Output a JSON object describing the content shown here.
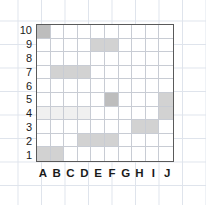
{
  "figure": {
    "type": "grid-coordinate-chart",
    "columns": [
      "A",
      "B",
      "C",
      "D",
      "E",
      "F",
      "G",
      "H",
      "I",
      "J"
    ],
    "rows": [
      "10",
      "9",
      "8",
      "7",
      "6",
      "5",
      "4",
      "3",
      "2",
      "1"
    ],
    "border_color": "#5a5a5a",
    "gridline_color": "#c8ccd4",
    "background_color": "#ffffff"
  },
  "chart_data": {
    "type": "heatmap",
    "title": "",
    "xlabel": "",
    "ylabel": "",
    "x_categories": [
      "A",
      "B",
      "C",
      "D",
      "E",
      "F",
      "G",
      "H",
      "I",
      "J"
    ],
    "y_categories": [
      "10",
      "9",
      "8",
      "7",
      "6",
      "5",
      "4",
      "3",
      "2",
      "1"
    ],
    "grid": true,
    "legend": "none",
    "shades": {
      "empty": "#ffffff",
      "faint": "#f0f0f0",
      "light": "#e2e2e2",
      "medium": "#d2d2d2",
      "dark": "#bdbdbd"
    },
    "values": [
      [
        "dark",
        "empty",
        "empty",
        "empty",
        "empty",
        "empty",
        "empty",
        "empty",
        "empty",
        "empty"
      ],
      [
        "empty",
        "empty",
        "empty",
        "empty",
        "medium",
        "medium",
        "empty",
        "empty",
        "empty",
        "empty"
      ],
      [
        "empty",
        "empty",
        "empty",
        "empty",
        "empty",
        "empty",
        "empty",
        "empty",
        "empty",
        "empty"
      ],
      [
        "empty",
        "medium",
        "medium",
        "medium",
        "empty",
        "empty",
        "empty",
        "empty",
        "empty",
        "empty"
      ],
      [
        "empty",
        "empty",
        "empty",
        "empty",
        "empty",
        "empty",
        "empty",
        "empty",
        "empty",
        "empty"
      ],
      [
        "empty",
        "empty",
        "empty",
        "empty",
        "empty",
        "dark",
        "empty",
        "empty",
        "empty",
        "medium"
      ],
      [
        "faint",
        "faint",
        "faint",
        "faint",
        "empty",
        "empty",
        "empty",
        "empty",
        "empty",
        "medium"
      ],
      [
        "empty",
        "empty",
        "empty",
        "empty",
        "empty",
        "empty",
        "empty",
        "medium",
        "medium",
        "empty"
      ],
      [
        "empty",
        "empty",
        "empty",
        "medium",
        "medium",
        "medium",
        "empty",
        "empty",
        "empty",
        "empty"
      ],
      [
        "medium",
        "medium",
        "empty",
        "empty",
        "empty",
        "empty",
        "empty",
        "empty",
        "empty",
        "empty"
      ]
    ],
    "filled_cells": [
      {
        "cell": "A10",
        "shade": "dark"
      },
      {
        "cell": "E9",
        "shade": "medium"
      },
      {
        "cell": "F9",
        "shade": "medium"
      },
      {
        "cell": "B7",
        "shade": "medium"
      },
      {
        "cell": "C7",
        "shade": "medium"
      },
      {
        "cell": "D7",
        "shade": "medium"
      },
      {
        "cell": "F5",
        "shade": "dark"
      },
      {
        "cell": "J5",
        "shade": "medium"
      },
      {
        "cell": "A4",
        "shade": "faint"
      },
      {
        "cell": "B4",
        "shade": "faint"
      },
      {
        "cell": "C4",
        "shade": "faint"
      },
      {
        "cell": "D4",
        "shade": "faint"
      },
      {
        "cell": "J4",
        "shade": "medium"
      },
      {
        "cell": "H3",
        "shade": "medium"
      },
      {
        "cell": "I3",
        "shade": "medium"
      },
      {
        "cell": "D2",
        "shade": "medium"
      },
      {
        "cell": "E2",
        "shade": "medium"
      },
      {
        "cell": "F2",
        "shade": "medium"
      },
      {
        "cell": "A1",
        "shade": "medium"
      },
      {
        "cell": "B1",
        "shade": "medium"
      }
    ]
  }
}
